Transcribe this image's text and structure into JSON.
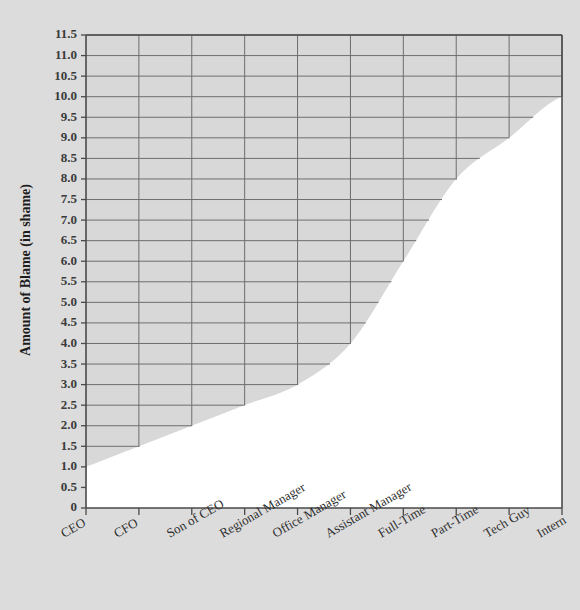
{
  "figure": {
    "background_color": "#dcdcdc",
    "plot_background_color": "#d8d8d8",
    "data_fill_color": "#ffffff",
    "gridline_color": "#6e6e6e",
    "axis_color": "#4a4a4a"
  },
  "axes": {
    "ylabel": "Amount of Blame (in shame)",
    "xlabel": "",
    "ytick_labels": [
      "0",
      "0.5",
      "1.0",
      "1.5",
      "2.0",
      "2.5",
      "3.0",
      "3.5",
      "4.0",
      "4.5",
      "5.0",
      "5.5",
      "6.0",
      "6.5",
      "7.0",
      "7.5",
      "8.0",
      "8.5",
      "9.0",
      "9.5",
      "10.0",
      "10.5",
      "11.0",
      "11.5"
    ]
  },
  "chart_data": {
    "type": "area",
    "title": "",
    "xlabel": "",
    "ylabel": "Amount of Blame (in shame)",
    "categories": [
      "CEO",
      "CFO",
      "Son of CEO",
      "Regional Manager",
      "Office Manager",
      "Assistant Manager",
      "Full-Time",
      "Part-Time",
      "Tech Guy",
      "Intern"
    ],
    "values": [
      1.0,
      1.5,
      2.0,
      2.5,
      3.0,
      4.0,
      6.0,
      8.0,
      9.0,
      10.0
    ],
    "baseline_value": 0.5,
    "ylim": [
      0,
      11.5
    ],
    "ytick_step": 0.5,
    "ytick_values": [
      0,
      0.5,
      1.0,
      1.5,
      2.0,
      2.5,
      3.0,
      3.5,
      4.0,
      4.5,
      5.0,
      5.5,
      6.0,
      6.5,
      7.0,
      7.5,
      8.0,
      8.5,
      9.0,
      9.5,
      10.0,
      10.5,
      11.0,
      11.5
    ],
    "grid": true,
    "grid_truncates_at_curve": true,
    "legend": null,
    "legend_position": "none",
    "xtick_label_rotation": -30
  }
}
